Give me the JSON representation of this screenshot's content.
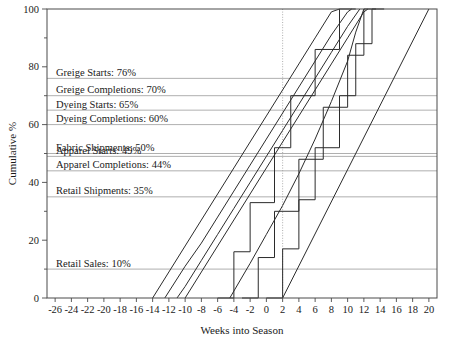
{
  "chart_data": {
    "type": "line",
    "title": "",
    "xlabel": "Weeks into Season",
    "ylabel": "Cumulative %",
    "xlim": [
      -27,
      21
    ],
    "ylim": [
      0,
      100
    ],
    "grid": "horizontal reference lines at each milestone level, vertical dotted line at week 2",
    "legend": "inline labels at left inside plot area",
    "xticks": [
      -26,
      -24,
      -22,
      -20,
      -18,
      -16,
      -14,
      -12,
      -10,
      -8,
      -6,
      -4,
      -2,
      0,
      2,
      4,
      6,
      8,
      10,
      12,
      14,
      16,
      18,
      20
    ],
    "xtick_labels": [
      "-26",
      "-24",
      "-22",
      "-20",
      "-18",
      "-16",
      "-14",
      "-12",
      "-10",
      "-8",
      "-6",
      "-4",
      "-2",
      "0",
      "2",
      "4",
      "6",
      "8",
      "10",
      "12",
      "14",
      "16",
      "18",
      "20"
    ],
    "yticks": [
      0,
      20,
      40,
      60,
      80,
      100
    ],
    "ytick_labels": [
      "0",
      "20",
      "40",
      "60",
      "80",
      "100"
    ],
    "yticks_minor": [
      10,
      30,
      50,
      70,
      90
    ],
    "milestones": [
      {
        "name": "Greige Starts",
        "value": 76,
        "label": "Greige Starts: 76%"
      },
      {
        "name": "Greige Completions",
        "value": 70,
        "label": "Greige Completions: 70%"
      },
      {
        "name": "Dyeing Starts",
        "value": 65,
        "label": "Dyeing Starts: 65%"
      },
      {
        "name": "Dyeing Completions",
        "value": 60,
        "label": "Dyeing Completions: 60%"
      },
      {
        "name": "Fabric Shipments",
        "value": 50,
        "label": "Fabric Shipments: 50%"
      },
      {
        "name": "Apparel Starts",
        "value": 49,
        "label": "Apparel Starts: 49%"
      },
      {
        "name": "Apparel Completions",
        "value": 44,
        "label": "Apparel Completions: 44%"
      },
      {
        "name": "Retail Shipments",
        "value": 35,
        "label": "Retail Shipments: 35%"
      },
      {
        "name": "Retail Sales",
        "value": 10,
        "label": "Retail Sales: 10%"
      }
    ],
    "series": [
      {
        "name": "Greige Starts",
        "start_week": -14,
        "end_week": 9,
        "points": [
          [
            -14,
            0
          ],
          [
            -12,
            9
          ],
          [
            -10,
            18
          ],
          [
            -8,
            27
          ],
          [
            -6,
            36
          ],
          [
            -4,
            45
          ],
          [
            -2,
            54
          ],
          [
            0,
            63
          ],
          [
            2,
            72
          ],
          [
            4,
            81
          ],
          [
            6,
            90
          ],
          [
            8,
            99
          ],
          [
            9,
            100
          ]
        ]
      },
      {
        "name": "Greige Completions",
        "start_week": -12.5,
        "end_week": 10.5,
        "points": [
          [
            -12.5,
            0
          ],
          [
            -10,
            11
          ],
          [
            -8,
            19
          ],
          [
            -6,
            28
          ],
          [
            -4,
            37
          ],
          [
            -2,
            46
          ],
          [
            0,
            55
          ],
          [
            2,
            64
          ],
          [
            4,
            73
          ],
          [
            6,
            82
          ],
          [
            8,
            91
          ],
          [
            10,
            99
          ],
          [
            10.5,
            100
          ]
        ]
      },
      {
        "name": "Dyeing Starts",
        "start_week": -11,
        "end_week": 11.5,
        "points": [
          [
            -11,
            0
          ],
          [
            -10,
            4
          ],
          [
            -8,
            13
          ],
          [
            -6,
            22
          ],
          [
            -4,
            31
          ],
          [
            -2,
            40
          ],
          [
            0,
            49
          ],
          [
            2,
            58
          ],
          [
            4,
            67
          ],
          [
            6,
            76
          ],
          [
            8,
            85
          ],
          [
            10,
            94
          ],
          [
            11.5,
            100
          ]
        ]
      },
      {
        "name": "Dyeing Completions",
        "start_week": -10,
        "end_week": 12.5,
        "points": [
          [
            -10,
            0
          ],
          [
            -8,
            9
          ],
          [
            -6,
            18
          ],
          [
            -4,
            27
          ],
          [
            -2,
            36
          ],
          [
            0,
            45
          ],
          [
            2,
            54
          ],
          [
            4,
            63
          ],
          [
            6,
            72
          ],
          [
            8,
            81
          ],
          [
            10,
            90
          ],
          [
            12,
            99
          ],
          [
            12.5,
            100
          ]
        ]
      },
      {
        "name": "Fabric Shipments",
        "start_week": -6,
        "end_week": 11,
        "stepped": true,
        "points": [
          [
            -6,
            0
          ],
          [
            -4,
            0
          ],
          [
            -4,
            16
          ],
          [
            -2,
            16
          ],
          [
            -2,
            33
          ],
          [
            1,
            33
          ],
          [
            1,
            52
          ],
          [
            3,
            52
          ],
          [
            3,
            70
          ],
          [
            6,
            70
          ],
          [
            6,
            86
          ],
          [
            9,
            86
          ],
          [
            9,
            100
          ],
          [
            11,
            100
          ]
        ]
      },
      {
        "name": "Apparel Starts",
        "start_week": -4.5,
        "end_week": 12,
        "points": [
          [
            -4.5,
            0
          ],
          [
            -2,
            12
          ],
          [
            0,
            22
          ],
          [
            2,
            32
          ],
          [
            4,
            43
          ],
          [
            6,
            55
          ],
          [
            8,
            68
          ],
          [
            10,
            82
          ],
          [
            11,
            92
          ],
          [
            12,
            100
          ]
        ]
      },
      {
        "name": "Apparel Completions",
        "start_week": -3,
        "end_week": 13.5,
        "stepped": true,
        "points": [
          [
            -3,
            0
          ],
          [
            -1,
            0
          ],
          [
            -1,
            14
          ],
          [
            1,
            14
          ],
          [
            1,
            30
          ],
          [
            4,
            30
          ],
          [
            4,
            48
          ],
          [
            7,
            48
          ],
          [
            7,
            66
          ],
          [
            10,
            66
          ],
          [
            10,
            84
          ],
          [
            12,
            84
          ],
          [
            12,
            100
          ],
          [
            13.5,
            100
          ]
        ]
      },
      {
        "name": "Retail Shipments",
        "start_week": 0,
        "end_week": 14.5,
        "stepped": true,
        "points": [
          [
            0,
            0
          ],
          [
            2,
            0
          ],
          [
            2,
            17
          ],
          [
            4,
            17
          ],
          [
            4,
            34
          ],
          [
            6,
            34
          ],
          [
            6,
            52
          ],
          [
            9,
            52
          ],
          [
            9,
            70
          ],
          [
            11,
            70
          ],
          [
            11,
            88
          ],
          [
            13,
            88
          ],
          [
            13,
            100
          ],
          [
            14.5,
            100
          ]
        ]
      },
      {
        "name": "Retail Sales",
        "start_week": 2,
        "end_week": 20,
        "points": [
          [
            2,
            0
          ],
          [
            20,
            100
          ]
        ]
      }
    ]
  }
}
